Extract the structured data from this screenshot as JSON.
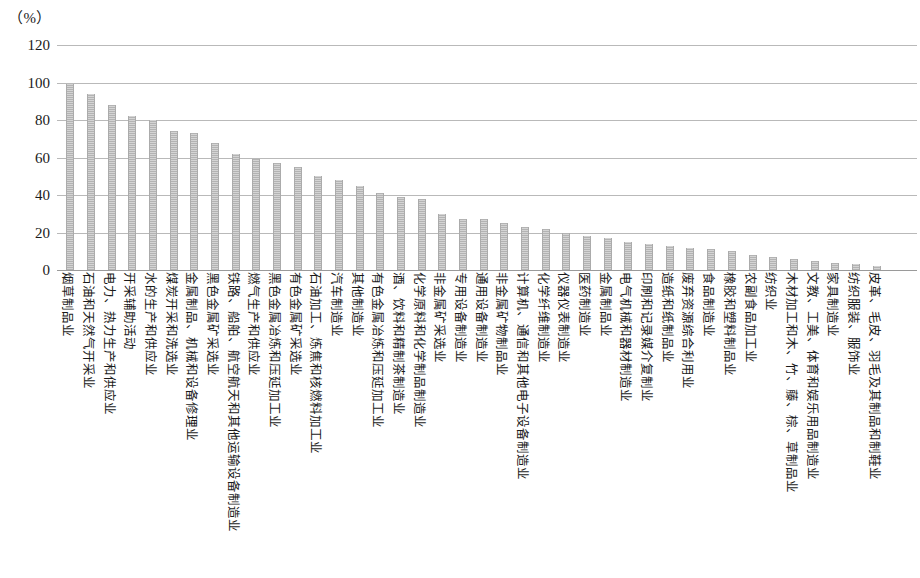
{
  "unit_label": "（%）",
  "axis": {
    "y_ticks": [
      "120",
      "100",
      "80",
      "60",
      "40",
      "20",
      "0"
    ],
    "y_min": 0,
    "y_max": 120,
    "y_step": 20
  },
  "colors": {
    "bar_fill": "#bdbdbd",
    "bar_edge": "#ababab",
    "gridline": "#b9b9b9",
    "text": "#1a1a1a"
  },
  "chart_data": {
    "type": "bar",
    "title": "",
    "xlabel": "",
    "ylabel": "",
    "unit": "%",
    "ylim": [
      0,
      120
    ],
    "y_ticks": [
      0,
      20,
      40,
      60,
      80,
      100,
      120
    ],
    "grid": true,
    "legend": null,
    "orientation": "vertical",
    "categories": [
      "烟草制品业",
      "石油和天然气开采业",
      "电力、热力生产和供应业",
      "开采辅助活动",
      "水的生产和供应业",
      "煤炭开采和洗选业",
      "金属制品、机械和设备修理业",
      "黑色金属矿采选业",
      "铁路、船舶、航空航天和其他运输设备制造业",
      "燃气生产和供应业",
      "黑色金属冶炼和压延加工业",
      "有色金属矿采选业",
      "石油加工、炼焦和核燃料加工业",
      "汽车制造业",
      "其他制造业",
      "有色金属冶炼和压延加工业",
      "酒、饮料和精制茶制造业",
      "化学原料和化学制品制造业",
      "非金属矿采选业",
      "专用设备制造业",
      "通用设备制造业",
      "非金属矿物制品业",
      "计算机、通信和其他电子设备制造业",
      "化学纤维制造业",
      "仪器仪表制造业",
      "医药制造业",
      "金属制品业",
      "电气机械和器材制造业",
      "印刷和记录媒介复制业",
      "造纸和纸制品业",
      "废弃资源综合利用业",
      "食品制造业",
      "橡胶和塑料制品业",
      "农副食品加工业",
      "纺织业",
      "木材加工和木、竹、藤、棕、草制品业",
      "文教、工美、体育和娱乐用品制造业",
      "家具制造业",
      "纺织服装、服饰业",
      "皮革、毛皮、羽毛及其制品和制鞋业"
    ],
    "values": [
      99,
      94,
      88,
      82,
      80,
      74,
      73,
      68,
      62,
      59,
      57,
      55,
      50,
      48,
      45,
      41,
      39,
      38,
      30,
      27,
      27,
      25,
      23,
      22,
      20,
      18,
      17,
      15,
      14,
      13,
      12,
      11,
      10,
      8,
      7,
      6,
      5,
      4,
      3,
      2
    ]
  }
}
